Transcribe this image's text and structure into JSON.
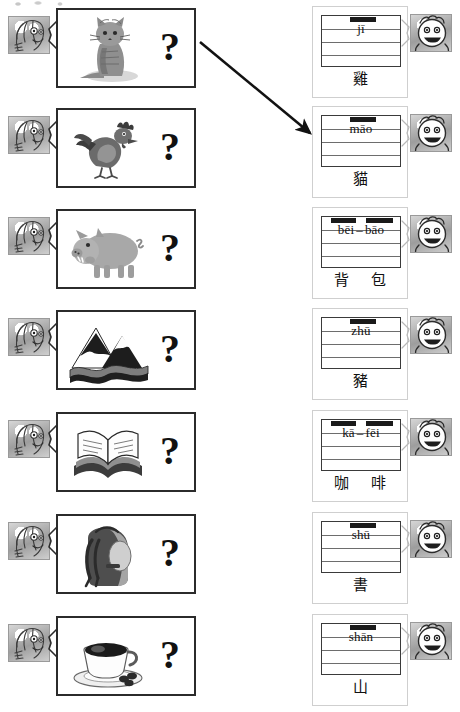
{
  "worksheet": {
    "title": "Chinese pinyin picture matching worksheet",
    "instruction_visible": false,
    "row_count": 7,
    "example_arrow": {
      "name": "example-matching-arrow",
      "from_row": 1,
      "to_row": 2,
      "x1": 200,
      "y1": 42,
      "x2": 310,
      "y2": 133
    },
    "colors": {
      "ink": "#111111",
      "card_border": "#2b2b2b",
      "grid_line": "#6d6d6d",
      "redaction_bar": "#1a1a1a",
      "page_background": "#ffffff"
    }
  },
  "rows": [
    {
      "index": 1,
      "top": 4,
      "picture": {
        "icon": "cat-photo",
        "alt": "photograph of a sitting tabby cat",
        "art": "cat"
      },
      "question_mark": "?",
      "left_face_icon": "student-face-icon",
      "right_face_icon": "smiling-face-icon",
      "answer": {
        "pinyin_syllables": [
          "jī"
        ],
        "pinyin_display": "jī",
        "hanzi": [
          "雞"
        ],
        "grid_lines": 3
      }
    },
    {
      "index": 2,
      "top": 104,
      "picture": {
        "icon": "rooster-drawing",
        "alt": "cartoon drawing of a rooster",
        "art": "rooster"
      },
      "question_mark": "?",
      "left_face_icon": "student-face-icon",
      "right_face_icon": "smiling-face-icon",
      "answer": {
        "pinyin_syllables": [
          "māo"
        ],
        "pinyin_display": "māo",
        "hanzi": [
          "貓"
        ],
        "grid_lines": 3
      }
    },
    {
      "index": 3,
      "top": 205,
      "picture": {
        "icon": "pig-drawing",
        "alt": "cartoon drawing of a pink pig",
        "art": "pig"
      },
      "question_mark": "?",
      "left_face_icon": "student-face-icon",
      "right_face_icon": "smiling-face-icon",
      "answer": {
        "pinyin_syllables": [
          "bēi",
          "bāo"
        ],
        "pinyin_display": "bēi – bāo",
        "hanzi": [
          "背",
          "包"
        ],
        "grid_lines": 3
      }
    },
    {
      "index": 4,
      "top": 306,
      "picture": {
        "icon": "mountain-drawing",
        "alt": "drawing of snow-capped mountains with a river",
        "art": "mountain"
      },
      "question_mark": "?",
      "left_face_icon": "student-face-icon",
      "right_face_icon": "smiling-face-icon",
      "answer": {
        "pinyin_syllables": [
          "zhū"
        ],
        "pinyin_display": "zhū",
        "hanzi": [
          "豬"
        ],
        "grid_lines": 3
      }
    },
    {
      "index": 5,
      "top": 408,
      "picture": {
        "icon": "open-book-drawing",
        "alt": "drawing of an open book",
        "art": "book"
      },
      "question_mark": "?",
      "left_face_icon": "student-face-icon",
      "right_face_icon": "smiling-face-icon",
      "answer": {
        "pinyin_syllables": [
          "kā",
          "fēi"
        ],
        "pinyin_display": "kā – fēi",
        "hanzi": [
          "咖",
          "啡"
        ],
        "grid_lines": 3
      }
    },
    {
      "index": 6,
      "top": 510,
      "picture": {
        "icon": "backpack-photo",
        "alt": "photograph of a hiking backpack",
        "art": "backpack"
      },
      "question_mark": "?",
      "left_face_icon": "student-face-icon",
      "right_face_icon": "smiling-face-icon",
      "answer": {
        "pinyin_syllables": [
          "shū"
        ],
        "pinyin_display": "shū",
        "hanzi": [
          "書"
        ],
        "grid_lines": 3
      }
    },
    {
      "index": 7,
      "top": 612,
      "picture": {
        "icon": "coffee-cup-photo",
        "alt": "photograph of a cup of coffee with beans",
        "art": "coffee"
      },
      "question_mark": "?",
      "left_face_icon": "student-face-icon",
      "right_face_icon": "smiling-face-icon",
      "answer": {
        "pinyin_syllables": [
          "shān"
        ],
        "pinyin_display": "shān",
        "hanzi": [
          "山"
        ],
        "grid_lines": 3
      }
    }
  ]
}
